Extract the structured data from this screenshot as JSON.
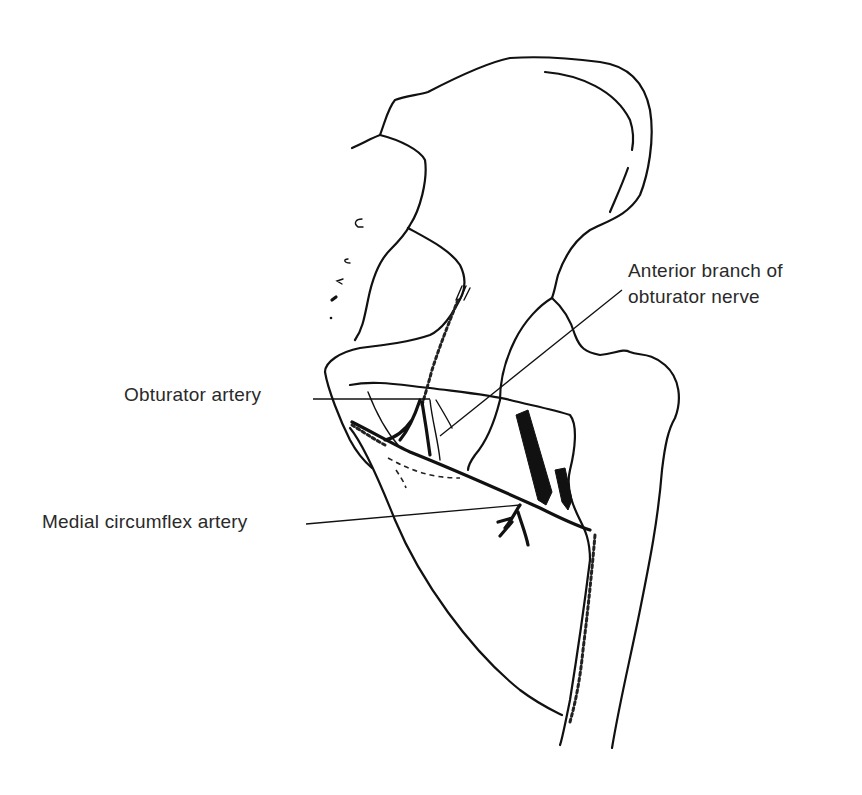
{
  "figure": {
    "type": "anatomical line drawing",
    "stroke_color": "#111111",
    "background_color": "#ffffff",
    "label_color": "#2a2a2a"
  },
  "labels": {
    "anterior_branch_line1": "Anterior branch of",
    "anterior_branch_line2": "obturator nerve",
    "obturator_artery": "Obturator artery",
    "medial_circumflex_artery": "Medial circumflex artery"
  }
}
